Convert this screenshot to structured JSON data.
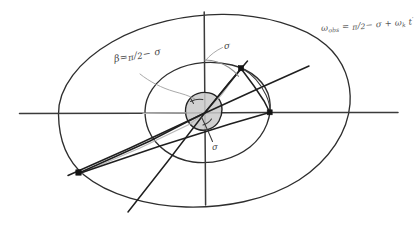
{
  "figure": {
    "style": "hand-drawn pencil sketch on white paper",
    "background_color": "#ffffff",
    "ink_color": "#2b2b2b",
    "faint_ink_color": "#b9b9b9",
    "disc_fill_color": "#c9c9c9"
  },
  "annotations": {
    "beta_relation": {
      "label": "β = π/2 − σ",
      "beta_symbol": "β",
      "equals": "=",
      "numerator": "π",
      "denominator": "2",
      "minus_sigma": "− σ"
    },
    "sigma_top": {
      "label": "σ"
    },
    "sigma_center": {
      "label": "σ"
    },
    "equation": {
      "full": "ωₒᵇₛ = π/2 − σ + ωₖ t'",
      "lhs": "ω",
      "lhs_sub": "obs",
      "equals": "=",
      "numerator": "π",
      "denominator": "2",
      "minus_sigma": "− σ",
      "plus": "+",
      "omega_k": "ω",
      "omega_k_sub": "k",
      "time": "t",
      "time_prime": "′"
    }
  },
  "geometry": {
    "outer_ellipse": {
      "cx": 204,
      "cy": 111,
      "rx": 146,
      "ry": 97
    },
    "inner_ellipse": {
      "cx": 207,
      "cy": 112,
      "rx": 63,
      "ry": 51
    },
    "central_disc": {
      "cx": 203,
      "cy": 113,
      "r": 18
    },
    "horizontal_axis": {
      "x1": 19,
      "y1": 113,
      "x2": 398,
      "y2": 113
    },
    "vertical_axis": {
      "x1": 204,
      "y1": 12,
      "x2": 205,
      "y2": 205
    },
    "nodes": [
      {
        "name": "upper-right-node",
        "x": 241,
        "y": 68
      },
      {
        "name": "right-node",
        "x": 270,
        "y": 112
      },
      {
        "name": "lower-left-node",
        "x": 78,
        "y": 172
      }
    ],
    "major_axis_line": {
      "x1": 68,
      "y1": 175,
      "x2": 309,
      "y2": 66
    },
    "steep_line": {
      "x1": 128,
      "y1": 212,
      "x2": 248,
      "y2": 61
    }
  }
}
